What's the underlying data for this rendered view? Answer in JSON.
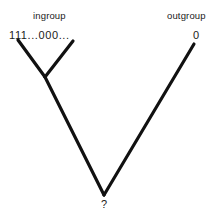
{
  "figure": {
    "type": "cladogram",
    "background_color": "#ffffff",
    "line_color": "#111111",
    "text_color": "#1a1a1a",
    "width": 219,
    "height": 222
  },
  "labels": {
    "ingroup": "ingroup",
    "outgroup": "outgroup"
  },
  "character_states": {
    "ingroup_states": "111...000...",
    "outgroup_state": "0",
    "root_state": "?"
  },
  "tree": {
    "branches": [
      {
        "name": "ingroup-left-branch",
        "x1": 18,
        "y1": 40,
        "x2": 45,
        "y2": 77
      },
      {
        "name": "ingroup-right-branch",
        "x1": 73,
        "y1": 41,
        "x2": 45,
        "y2": 77
      },
      {
        "name": "ingroup-stem-branch",
        "x1": 45,
        "y1": 77,
        "x2": 104,
        "y2": 195
      },
      {
        "name": "outgroup-branch",
        "x1": 104,
        "y1": 195,
        "x2": 194,
        "y2": 44
      }
    ],
    "nodes": {
      "ingroup_node": {
        "x": 45,
        "y": 77
      },
      "root_node": {
        "x": 104,
        "y": 195
      }
    },
    "line_width": 3.2
  }
}
